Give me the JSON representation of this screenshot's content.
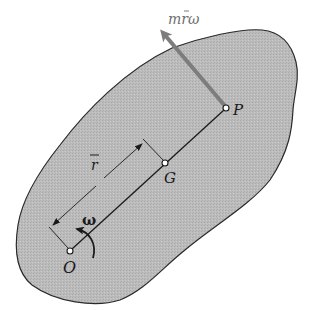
{
  "diagram": {
    "type": "rigid-body-rotation-about-fixed-axis",
    "colors": {
      "body_fill": "#b9b9b9",
      "outline": "#2a2a2a",
      "line": "#1a1a1a",
      "momentum_arrow": "#7d7d7d",
      "background": "#ffffff"
    },
    "points": {
      "O": {
        "label": "O",
        "description": "fixed rotation axis"
      },
      "G": {
        "label": "G",
        "description": "center of mass"
      },
      "P": {
        "label": "P",
        "description": "center of percussion"
      }
    },
    "labels": {
      "momentum": "mr̄ω",
      "momentum_main": "mrω",
      "distance": "r",
      "angular_velocity": "ω"
    },
    "annotations": [
      {
        "id": "momentum-vector",
        "text": "mr̄ω",
        "applied_at": "P",
        "direction": "perpendicular to OP"
      },
      {
        "id": "distance-dimension",
        "text": "r̄",
        "from": "O",
        "to": "G"
      },
      {
        "id": "angular-velocity",
        "text": "ω",
        "about": "O",
        "sense": "counterclockwise"
      }
    ]
  }
}
